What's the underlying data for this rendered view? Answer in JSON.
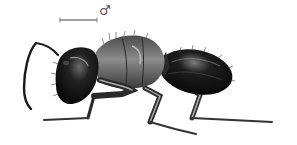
{
  "figure": {
    "view": "lateral",
    "style": "stippled scientific illustration",
    "sex_symbol": "♂",
    "scale_bar": {
      "present": true
    }
  },
  "colors": {
    "background": "#ffffff",
    "body_dark": "#111111",
    "body_mid": "#5a5a5a",
    "body_light": "#bdbdbd",
    "scale_bar": "#777777"
  }
}
